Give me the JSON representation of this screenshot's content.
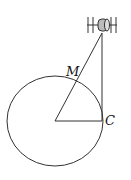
{
  "diagram": {
    "labels": {
      "M": "M",
      "C": "C"
    },
    "stroke_color": "#333333",
    "satellite_fill": "#bbbbbb"
  }
}
